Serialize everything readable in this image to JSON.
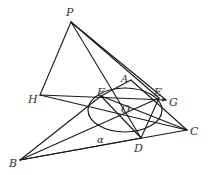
{
  "diagram": {
    "type": "geometry",
    "points": {
      "P": {
        "label": "P",
        "x": 71,
        "y": 22,
        "lx": 66,
        "ly": 16
      },
      "H": {
        "label": "H",
        "x": 40,
        "y": 95,
        "lx": 28,
        "ly": 103
      },
      "A": {
        "label": "A",
        "x": 131,
        "y": 80,
        "lx": 121,
        "ly": 82
      },
      "F": {
        "label": "F",
        "x": 101,
        "y": 96,
        "lx": 97,
        "ly": 96
      },
      "E": {
        "label": "E",
        "x": 159,
        "y": 98,
        "lx": 154,
        "ly": 96
      },
      "G": {
        "label": "G",
        "x": 166,
        "y": 100,
        "lx": 169,
        "ly": 106
      },
      "O": {
        "label": "O",
        "x": 126,
        "y": 110,
        "lx": 121,
        "ly": 113
      },
      "D": {
        "label": "D",
        "x": 141,
        "y": 138,
        "lx": 134,
        "ly": 152
      },
      "C": {
        "label": "C",
        "x": 187,
        "y": 130,
        "lx": 190,
        "ly": 135
      },
      "B": {
        "label": "B",
        "x": 20,
        "y": 160,
        "lx": 9,
        "ly": 167
      }
    },
    "angle_label": {
      "label": "α",
      "x": 97,
      "y": 143
    },
    "ellipse": {
      "cx": 125,
      "cy": 110,
      "rx": 37,
      "ry": 22
    }
  }
}
